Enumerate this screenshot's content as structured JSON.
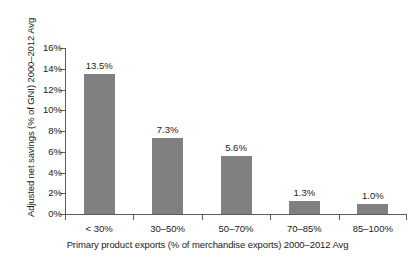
{
  "chart_data": {
    "type": "bar",
    "title": "",
    "subtitle": "",
    "categories": [
      "< 30%",
      "30–50%",
      "50–70%",
      "70–85%",
      "85–100%"
    ],
    "values": [
      13.5,
      7.3,
      5.6,
      1.3,
      1.0
    ],
    "data_labels": [
      "13.5%",
      "7.3%",
      "5.6%",
      "1.3%",
      "1.0%"
    ],
    "xlabel": "Primary product exports (% of merchandise exports) 2000–2012 Avg",
    "ylabel": "Adjusted net savings (% of GNI) 2000–2012 Avg",
    "ylim": [
      0,
      16
    ],
    "ytick_values": [
      0,
      2,
      4,
      6,
      8,
      10,
      12,
      14,
      16
    ],
    "ytick_labels": [
      "0%",
      "2%",
      "4%",
      "6%",
      "8%",
      "10%",
      "12%",
      "14%",
      "16%"
    ],
    "grid": false,
    "legend": null,
    "legend_position": "none",
    "bar_color": "#808080",
    "axis_color": "#5d5d5d",
    "text_color": "#1a1a1a",
    "background_color": "#ffffff"
  }
}
